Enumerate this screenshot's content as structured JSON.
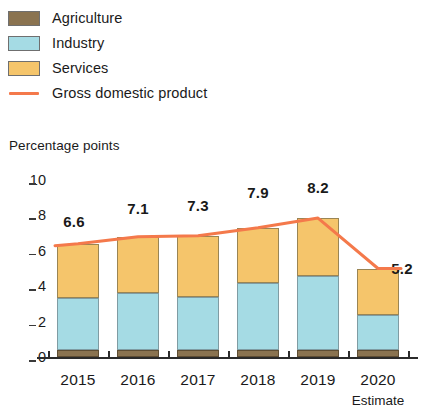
{
  "legend": {
    "items": [
      {
        "label": "Agriculture",
        "color": "#8a7350",
        "marker": "swatch"
      },
      {
        "label": "Industry",
        "color": "#a5dbe4",
        "marker": "swatch"
      },
      {
        "label": "Services",
        "color": "#f5c56b",
        "marker": "swatch"
      },
      {
        "label": "Gross domestic product",
        "color": "#f4794b",
        "marker": "line"
      }
    ]
  },
  "axis_title": "Percentage points",
  "estimate_note": "Estimate",
  "chart_data": {
    "type": "bar",
    "title": "",
    "subtitle": "",
    "xlabel": "",
    "ylabel": "Percentage points",
    "ylim": [
      0,
      10
    ],
    "yticks": [
      0,
      2,
      4,
      6,
      8,
      10
    ],
    "ytick_labels": [
      "0",
      "2",
      "4",
      "6",
      "8",
      "10"
    ],
    "grid": false,
    "stacked": true,
    "legend_position": "top-left",
    "categories": [
      "2015",
      "2016",
      "2017",
      "2018",
      "2019",
      "2020"
    ],
    "category_notes": [
      "",
      "",
      "",
      "",
      "",
      "Estimate"
    ],
    "series": [
      {
        "name": "Agriculture",
        "color": "#8a7350",
        "values": [
          0.4,
          0.4,
          0.4,
          0.4,
          0.4,
          0.4
        ]
      },
      {
        "name": "Industry",
        "color": "#a5dbe4",
        "values": [
          2.95,
          3.2,
          3.0,
          3.8,
          4.2,
          1.95
        ]
      },
      {
        "name": "Services",
        "color": "#f5c56b",
        "values": [
          3.05,
          3.2,
          3.45,
          3.1,
          3.25,
          2.65
        ]
      }
    ],
    "overlay_series": [
      {
        "name": "Gross domestic product",
        "type": "line",
        "color": "#f4794b",
        "values": [
          6.6,
          7.1,
          7.3,
          7.9,
          8.2,
          5.2
        ],
        "data_labels": [
          "6.6",
          "7.1",
          "7.3",
          "7.9",
          "8.2",
          "5.2"
        ]
      }
    ]
  }
}
